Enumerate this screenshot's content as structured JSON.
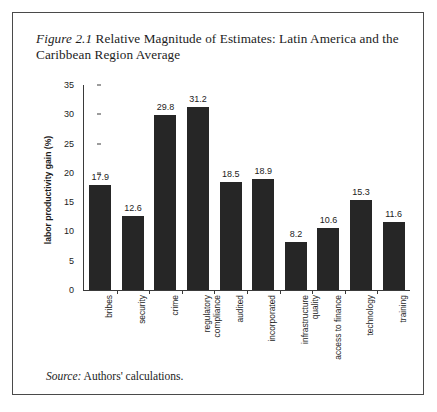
{
  "figure": {
    "number": "Figure 2.1",
    "title_rest": " Relative Magnitude of Estimates: Latin America and the Caribbean Region Average",
    "source_label": "Source:",
    "source_text": " Authors' calculations.",
    "border_color": "#4a4a4a"
  },
  "chart_data": {
    "type": "bar",
    "title": "Figure 2.1 Relative Magnitude of Estimates: Latin America and the Caribbean Region Average",
    "xlabel": "",
    "ylabel": "labor productivity gain (%)",
    "ylim": [
      0,
      35
    ],
    "ytick_step": 5,
    "yticks": [
      "0",
      "5",
      "10",
      "15",
      "20",
      "25",
      "30",
      "35"
    ],
    "grid": false,
    "legend": null,
    "bar_color": "#262626",
    "categories": [
      "bribes",
      "security",
      "crime",
      "regulatory compliance",
      "audited",
      "incorporated",
      "infrastructure quality",
      "access to finance",
      "technology",
      "training"
    ],
    "values": [
      17.9,
      12.6,
      29.8,
      31.2,
      18.5,
      18.9,
      8.2,
      10.6,
      15.3,
      11.6
    ],
    "value_labels": [
      "17.9",
      "12.6",
      "29.8",
      "31.2",
      "18.5",
      "18.9",
      "8.2",
      "10.6",
      "15.3",
      "11.6"
    ]
  }
}
